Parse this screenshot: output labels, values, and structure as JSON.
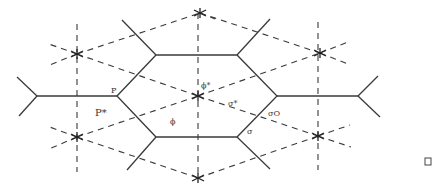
{
  "figure": {
    "labels": {
      "P": "P",
      "P_star": "P*",
      "phi": "ϕ",
      "phi_star": "ϕ*",
      "sigma": "σ",
      "sigma_star": "σ*",
      "sigma_o": "σO"
    },
    "end_mark": "□"
  }
}
